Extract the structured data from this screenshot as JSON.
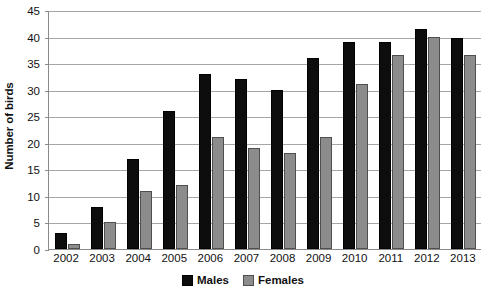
{
  "chart_data": {
    "type": "bar",
    "title": "",
    "subtitle": "",
    "xlabel": "",
    "ylabel": "Number of birds",
    "categories": [
      "2002",
      "2003",
      "2004",
      "2005",
      "2006",
      "2007",
      "2008",
      "2009",
      "2010",
      "2011",
      "2012",
      "2013"
    ],
    "series": [
      {
        "name": "Males",
        "color": "#0d0d0d",
        "values": [
          3,
          8,
          17,
          26,
          33,
          32,
          30,
          36,
          39,
          39,
          41.5,
          39.8
        ]
      },
      {
        "name": "Females",
        "color": "#8c8c8c",
        "values": [
          1,
          5,
          11,
          12,
          21,
          19,
          18,
          21,
          31,
          36.5,
          40,
          36.5
        ]
      }
    ],
    "ylim": [
      0,
      45
    ],
    "ytick_step": 5,
    "yticks": [
      "45",
      "40",
      "35",
      "30",
      "25",
      "20",
      "15",
      "10",
      "5",
      "0"
    ],
    "grid": true,
    "legend_position": "bottom"
  },
  "legend": {
    "items": [
      {
        "label": "Males"
      },
      {
        "label": "Females"
      }
    ]
  }
}
